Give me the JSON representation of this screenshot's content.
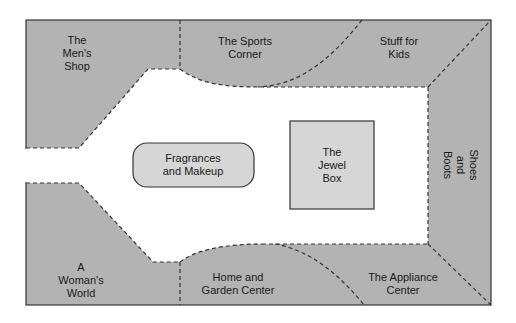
{
  "diagram": {
    "type": "store floor plan",
    "colors": {
      "department_fill": "#b3b3b3",
      "kiosk_fill": "#d6d6d6",
      "aisle_fill": "#ffffff",
      "border": "#333333"
    },
    "departments": [
      {
        "id": "mens-shop",
        "lines": [
          "The",
          "Men's",
          "Shop"
        ]
      },
      {
        "id": "sports-corner",
        "lines": [
          "The Sports",
          "Corner"
        ]
      },
      {
        "id": "stuff-for-kids",
        "lines": [
          "Stuff for",
          "Kids"
        ]
      },
      {
        "id": "shoes-and-boots",
        "lines": [
          "Shoes",
          "and",
          "Boots"
        ]
      },
      {
        "id": "appliance-center",
        "lines": [
          "The Appliance",
          "Center"
        ]
      },
      {
        "id": "home-and-garden",
        "lines": [
          "Home and",
          "Garden Center"
        ]
      },
      {
        "id": "womans-world",
        "lines": [
          "A",
          "Woman's",
          "World"
        ]
      }
    ],
    "kiosks": [
      {
        "id": "fragrances-makeup",
        "lines": [
          "Fragrances",
          "and Makeup"
        ]
      },
      {
        "id": "jewel-box",
        "lines": [
          "The",
          "Jewel",
          "Box"
        ]
      }
    ]
  }
}
